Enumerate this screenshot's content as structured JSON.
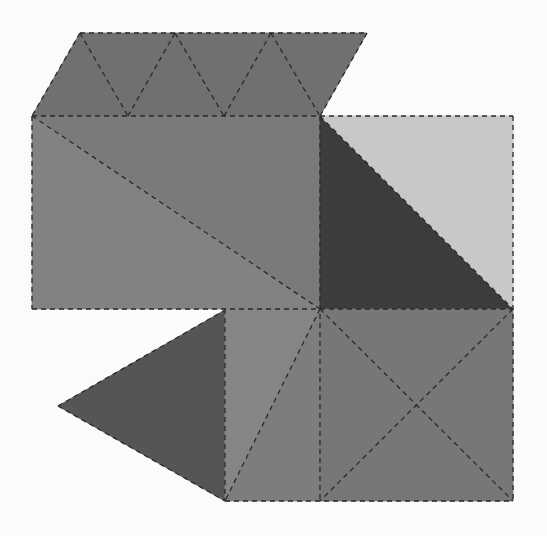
{
  "diagram": {
    "type": "polyhedron-net",
    "background": "#fbfbfb",
    "fold_line_color": "#2a2a2a",
    "faces": [
      {
        "id": "top-strip",
        "points": [
          [
            80,
            33
          ],
          [
            367,
            33
          ],
          [
            320,
            116
          ],
          [
            32,
            116
          ]
        ],
        "fill": "#707070"
      },
      {
        "id": "left-rect-upper",
        "points": [
          [
            32,
            116
          ],
          [
            320,
            116
          ],
          [
            320,
            309
          ]
        ],
        "fill": "#7a7a7a"
      },
      {
        "id": "left-rect-lower",
        "points": [
          [
            32,
            116
          ],
          [
            320,
            309
          ],
          [
            32,
            309
          ]
        ],
        "fill": "#828282"
      },
      {
        "id": "right-square-dark",
        "points": [
          [
            320,
            116
          ],
          [
            513,
            309
          ],
          [
            320,
            309
          ]
        ],
        "fill": "#3c3c3c"
      },
      {
        "id": "right-square-light",
        "points": [
          [
            320,
            116
          ],
          [
            513,
            116
          ],
          [
            513,
            309
          ]
        ],
        "fill": "#c8c8c8"
      },
      {
        "id": "left-triangle",
        "points": [
          [
            58,
            406
          ],
          [
            225,
            310
          ],
          [
            225,
            501
          ]
        ],
        "fill": "#555555"
      },
      {
        "id": "middle-rect-left",
        "points": [
          [
            225,
            309
          ],
          [
            320,
            309
          ],
          [
            225,
            501
          ]
        ],
        "fill": "#858585"
      },
      {
        "id": "middle-rect-right",
        "points": [
          [
            320,
            309
          ],
          [
            320,
            501
          ],
          [
            225,
            501
          ]
        ],
        "fill": "#7d7d7d"
      },
      {
        "id": "bottom-square",
        "points": [
          [
            320,
            309
          ],
          [
            513,
            309
          ],
          [
            513,
            501
          ],
          [
            320,
            501
          ]
        ],
        "fill": "#777777"
      }
    ],
    "fold_lines": [
      [
        [
          80,
          33
        ],
        [
          367,
          33
        ]
      ],
      [
        [
          80,
          33
        ],
        [
          32,
          116
        ]
      ],
      [
        [
          367,
          33
        ],
        [
          320,
          116
        ]
      ],
      [
        [
          80,
          33
        ],
        [
          128,
          116
        ]
      ],
      [
        [
          128,
          116
        ],
        [
          175,
          33
        ]
      ],
      [
        [
          175,
          33
        ],
        [
          224,
          116
        ]
      ],
      [
        [
          224,
          116
        ],
        [
          271,
          33
        ]
      ],
      [
        [
          271,
          33
        ],
        [
          320,
          116
        ]
      ],
      [
        [
          32,
          116
        ],
        [
          513,
          116
        ]
      ],
      [
        [
          32,
          116
        ],
        [
          32,
          309
        ]
      ],
      [
        [
          32,
          116
        ],
        [
          320,
          309
        ]
      ],
      [
        [
          320,
          116
        ],
        [
          320,
          501
        ]
      ],
      [
        [
          513,
          116
        ],
        [
          513,
          501
        ]
      ],
      [
        [
          32,
          309
        ],
        [
          513,
          309
        ]
      ],
      [
        [
          320,
          116
        ],
        [
          513,
          309
        ]
      ],
      [
        [
          58,
          406
        ],
        [
          225,
          310
        ]
      ],
      [
        [
          58,
          406
        ],
        [
          225,
          501
        ]
      ],
      [
        [
          225,
          309
        ],
        [
          225,
          501
        ]
      ],
      [
        [
          320,
          309
        ],
        [
          225,
          501
        ]
      ],
      [
        [
          225,
          501
        ],
        [
          513,
          501
        ]
      ],
      [
        [
          320,
          309
        ],
        [
          513,
          501
        ]
      ],
      [
        [
          513,
          309
        ],
        [
          320,
          501
        ]
      ]
    ]
  }
}
